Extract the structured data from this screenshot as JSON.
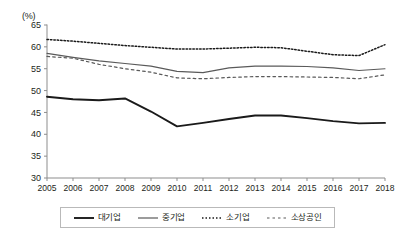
{
  "chart_data": {
    "type": "line",
    "title": "",
    "subtitle": "",
    "unit_label": "(%)",
    "xlabel": "",
    "ylabel": "",
    "grid": false,
    "legend_position": "bottom",
    "xlim": [
      2005,
      2018
    ],
    "ylim": [
      30,
      65
    ],
    "ytick_step": 5,
    "yticks": [
      30,
      35,
      40,
      45,
      50,
      55,
      60,
      65
    ],
    "categories": [
      "2005",
      "2006",
      "2007",
      "2008",
      "2009",
      "2010",
      "2011",
      "2012",
      "2013",
      "2014",
      "2015",
      "2016",
      "2017",
      "2018"
    ],
    "x": [
      2005,
      2006,
      2007,
      2008,
      2009,
      2010,
      2011,
      2012,
      2013,
      2014,
      2015,
      2016,
      2017,
      2018
    ],
    "series": [
      {
        "name": "대기업",
        "style": "solid-thick",
        "color": "#1a1a1a",
        "width": 1.9,
        "values": [
          48.6,
          48.0,
          47.8,
          48.2,
          45.2,
          41.8,
          42.6,
          43.5,
          44.3,
          44.3,
          43.7,
          43.0,
          42.5,
          42.6
        ]
      },
      {
        "name": "중기업",
        "style": "solid-thin",
        "color": "#5a5a5a",
        "width": 1.1,
        "values": [
          58.5,
          57.6,
          56.8,
          56.2,
          55.6,
          54.4,
          54.1,
          55.2,
          55.6,
          55.6,
          55.5,
          55.2,
          54.6,
          55.0
        ]
      },
      {
        "name": "소기업",
        "style": "dotted",
        "color": "#1a1a1a",
        "width": 1.5,
        "values": [
          61.7,
          61.3,
          60.8,
          60.3,
          59.9,
          59.5,
          59.5,
          59.7,
          59.9,
          59.8,
          59.0,
          58.2,
          58.0,
          60.5
        ]
      },
      {
        "name": "소상공인",
        "style": "dashed",
        "color": "#5a5a5a",
        "width": 1.2,
        "values": [
          57.8,
          57.4,
          56.0,
          55.0,
          54.2,
          52.9,
          52.7,
          53.0,
          53.2,
          53.2,
          53.1,
          53.0,
          52.7,
          53.6
        ]
      }
    ]
  },
  "legend": {
    "items": [
      {
        "label": "대기업"
      },
      {
        "label": "중기업"
      },
      {
        "label": "소기업"
      },
      {
        "label": "소상공인"
      }
    ]
  }
}
